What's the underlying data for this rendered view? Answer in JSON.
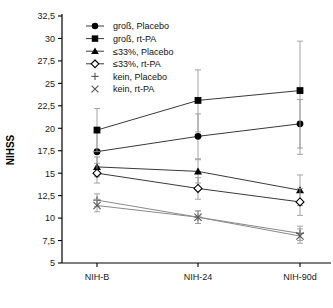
{
  "chart_data": {
    "type": "line",
    "title": "",
    "xlabel": "",
    "ylabel": "NIHSS",
    "categories": [
      "NIH-B",
      "NIH-24",
      "NIH-90d"
    ],
    "ylim": [
      5,
      32.5
    ],
    "ytick_labels": [
      "32,5",
      "30",
      "27,5",
      "25",
      "22,5",
      "20",
      "17,5",
      "15",
      "12,5",
      "10",
      "7,5",
      "5"
    ],
    "yticks": [
      32.5,
      30,
      27.5,
      25,
      22.5,
      20,
      17.5,
      15,
      12.5,
      10,
      7.5,
      5
    ],
    "grid": false,
    "legend_position": "top-left",
    "error_bars": "vertical",
    "series": [
      {
        "name": "groß, Placebo",
        "marker": "filled-circle",
        "values": [
          17.4,
          19.1,
          20.5
        ],
        "err_low": [
          15.0,
          16.6,
          17.8
        ],
        "err_high": [
          19.8,
          21.6,
          23.2
        ]
      },
      {
        "name": "groß, rt-PA",
        "marker": "filled-square",
        "values": [
          19.8,
          23.1,
          24.2
        ],
        "err_low": [
          17.4,
          19.6,
          17.1
        ],
        "err_high": [
          22.2,
          26.5,
          29.7
        ]
      },
      {
        "name": "≤33%, Placebo",
        "marker": "filled-triangle",
        "values": [
          15.7,
          15.2,
          13.1
        ],
        "err_low": [
          14.6,
          13.9,
          11.4
        ],
        "err_high": [
          16.8,
          16.5,
          14.8
        ]
      },
      {
        "name": "≤33%, rt-PA",
        "marker": "open-diamond",
        "values": [
          15.0,
          13.3,
          11.8
        ],
        "err_low": [
          13.9,
          12.1,
          10.3
        ],
        "err_high": [
          16.1,
          14.5,
          13.3
        ]
      },
      {
        "name": "kein, Placebo",
        "marker": "plus",
        "values": [
          12.0,
          10.1,
          8.3
        ],
        "err_low": [
          11.3,
          9.4,
          7.5
        ],
        "err_high": [
          12.7,
          10.8,
          9.1
        ]
      },
      {
        "name": "kein, rt-PA",
        "marker": "cross",
        "values": [
          11.4,
          10.1,
          8.0
        ],
        "err_low": [
          10.7,
          9.4,
          7.2
        ],
        "err_high": [
          12.1,
          10.8,
          8.8
        ]
      }
    ]
  },
  "legend": {
    "items": [
      {
        "label": "groß, Placebo",
        "marker": "filled-circle"
      },
      {
        "label": "groß, rt-PA",
        "marker": "filled-square"
      },
      {
        "label": "≤33%, Placebo",
        "marker": "filled-triangle"
      },
      {
        "label": "≤33%, rt-PA",
        "marker": "open-diamond"
      },
      {
        "label": "kein, Placebo",
        "marker": "plus"
      },
      {
        "label": "kein, rt-PA",
        "marker": "cross"
      }
    ]
  },
  "axes": {
    "y_title": "NIHSS",
    "y_labels": [
      "32,5",
      "30",
      "27,5",
      "25",
      "22,5",
      "20",
      "17,5",
      "15",
      "12,5",
      "10",
      "7,5",
      "5"
    ],
    "x_labels": [
      "NIH-B",
      "NIH-24",
      "NIH-90d"
    ]
  },
  "colors": {
    "line": "#3a3a3a",
    "line_light": "#8a8a8a",
    "marker": "#000000",
    "axis": "#000000",
    "background": "#ffffff"
  }
}
